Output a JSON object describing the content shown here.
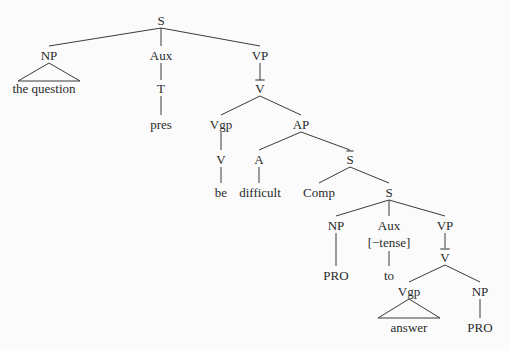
{
  "tree": {
    "nodes": [
      {
        "id": "s_root",
        "label": "S",
        "x": 161,
        "y": 20
      },
      {
        "id": "np_subj",
        "label": "NP",
        "x": 49,
        "y": 55
      },
      {
        "id": "aux_main",
        "label": "Aux",
        "x": 161,
        "y": 55
      },
      {
        "id": "vp_main",
        "label": "VP",
        "x": 260,
        "y": 55
      },
      {
        "id": "the_question",
        "label": "the question",
        "x": 44,
        "y": 88
      },
      {
        "id": "t_node",
        "label": "T",
        "x": 161,
        "y": 88
      },
      {
        "id": "vbar_main",
        "label": "V",
        "x": 260,
        "y": 88,
        "bar": true
      },
      {
        "id": "pres",
        "label": "pres",
        "x": 161,
        "y": 124
      },
      {
        "id": "vgp_main",
        "label": "Vgp",
        "x": 221,
        "y": 124
      },
      {
        "id": "ap",
        "label": "AP",
        "x": 301,
        "y": 124
      },
      {
        "id": "v_be",
        "label": "V",
        "x": 221,
        "y": 159
      },
      {
        "id": "a_node",
        "label": "A",
        "x": 259,
        "y": 159
      },
      {
        "id": "sbar",
        "label": "S",
        "x": 350,
        "y": 159,
        "bar": true
      },
      {
        "id": "be",
        "label": "be",
        "x": 221,
        "y": 192
      },
      {
        "id": "difficult",
        "label": "difficult",
        "x": 260,
        "y": 192
      },
      {
        "id": "comp",
        "label": "Comp",
        "x": 319,
        "y": 192
      },
      {
        "id": "s_emb",
        "label": "S",
        "x": 389,
        "y": 192
      },
      {
        "id": "np_emb",
        "label": "NP",
        "x": 336,
        "y": 225
      },
      {
        "id": "aux_emb",
        "label": "Aux",
        "x": 389,
        "y": 225
      },
      {
        "id": "tense_feat",
        "label": "[−tense]",
        "x": 389,
        "y": 242
      },
      {
        "id": "vp_emb",
        "label": "VP",
        "x": 445,
        "y": 225
      },
      {
        "id": "pro_subj",
        "label": "PRO",
        "x": 336,
        "y": 275
      },
      {
        "id": "to",
        "label": "to",
        "x": 389,
        "y": 275
      },
      {
        "id": "vbar_emb",
        "label": "V",
        "x": 445,
        "y": 257,
        "bar": true
      },
      {
        "id": "vgp_emb",
        "label": "Vgp",
        "x": 409,
        "y": 291
      },
      {
        "id": "np_obj",
        "label": "NP",
        "x": 480,
        "y": 291
      },
      {
        "id": "answer",
        "label": "answer",
        "x": 409,
        "y": 327
      },
      {
        "id": "pro_obj",
        "label": "PRO",
        "x": 480,
        "y": 327
      }
    ],
    "edges": [
      [
        161,
        28,
        49,
        46
      ],
      [
        161,
        28,
        161,
        46
      ],
      [
        161,
        28,
        260,
        46
      ],
      [
        161,
        63,
        161,
        80
      ],
      [
        161,
        96,
        161,
        115
      ],
      [
        260,
        63,
        260,
        80
      ],
      [
        260,
        96,
        221,
        115
      ],
      [
        260,
        96,
        301,
        115
      ],
      [
        221,
        132,
        221,
        150
      ],
      [
        221,
        167,
        221,
        183
      ],
      [
        301,
        132,
        259,
        150
      ],
      [
        301,
        132,
        350,
        150
      ],
      [
        259,
        167,
        259,
        183
      ],
      [
        350,
        167,
        319,
        183
      ],
      [
        350,
        167,
        389,
        183
      ],
      [
        389,
        200,
        336,
        216
      ],
      [
        389,
        200,
        389,
        216
      ],
      [
        389,
        200,
        445,
        216
      ],
      [
        336,
        233,
        336,
        266
      ],
      [
        389,
        251,
        389,
        266
      ],
      [
        445,
        233,
        445,
        248
      ],
      [
        445,
        265,
        409,
        282
      ],
      [
        445,
        265,
        480,
        282
      ],
      [
        480,
        299,
        480,
        318
      ]
    ],
    "triangles": [
      [
        49,
        63,
        18,
        81,
        80,
        81
      ],
      [
        409,
        299,
        378,
        318,
        440,
        318
      ]
    ]
  }
}
